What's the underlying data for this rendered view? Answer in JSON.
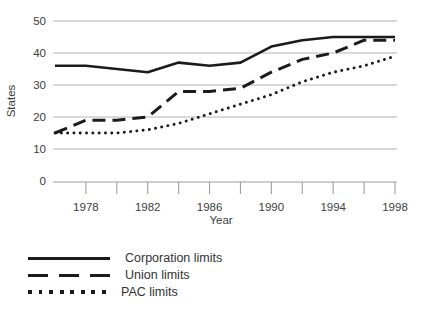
{
  "chart_data": {
    "type": "line",
    "title": "",
    "xlabel": "Year",
    "ylabel": "States",
    "x": [
      1976,
      1978,
      1980,
      1982,
      1984,
      1986,
      1988,
      1990,
      1992,
      1994,
      1996,
      1998
    ],
    "series": [
      {
        "name": "Corporation limits",
        "style": "solid",
        "values": [
          36,
          36,
          35,
          34,
          37,
          36,
          37,
          42,
          44,
          45,
          45,
          45
        ]
      },
      {
        "name": "Union limits",
        "style": "dashed",
        "values": [
          15,
          19,
          19,
          20,
          28,
          28,
          29,
          34,
          38,
          40,
          44,
          44
        ]
      },
      {
        "name": "PAC limits",
        "style": "dotted",
        "values": [
          15,
          15,
          15,
          16,
          18,
          21,
          24,
          27,
          31,
          34,
          36,
          39
        ]
      }
    ],
    "xlim": [
      1976,
      1998
    ],
    "ylim": [
      0,
      50
    ],
    "y_tick_labels": [
      0,
      10,
      20,
      30,
      40,
      50
    ],
    "x_tick_labels": [
      1978,
      1982,
      1986,
      1990,
      1994,
      1998
    ],
    "x_minor_tick_step": 2,
    "grid": true,
    "legend_position": "bottom-left",
    "colors": {
      "line": "#1b1b1b",
      "grid": "#b4b4b4",
      "axis": "#9e9e9e",
      "text": "#404040"
    }
  }
}
